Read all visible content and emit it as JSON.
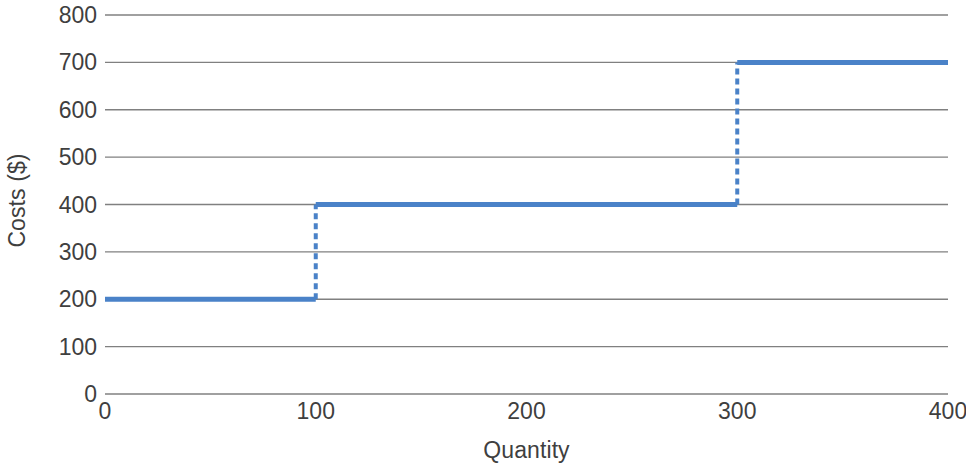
{
  "chart_data": {
    "type": "line",
    "subtype": "step",
    "title": "",
    "subtitle": "",
    "xlabel": "Quantity",
    "ylabel": "Costs ($)",
    "xlim": [
      0,
      400
    ],
    "ylim": [
      0,
      800
    ],
    "x_ticks": [
      0,
      100,
      200,
      300,
      400
    ],
    "x_tick_labels": [
      "0",
      "100",
      "200",
      "300",
      "400"
    ],
    "y_ticks": [
      0,
      100,
      200,
      300,
      400,
      500,
      600,
      700,
      800
    ],
    "y_tick_labels": [
      "0",
      "100",
      "200",
      "300",
      "400",
      "500",
      "600",
      "700",
      "800"
    ],
    "grid": {
      "horizontal": true,
      "vertical": false,
      "color": "#808080"
    },
    "legend": {
      "visible": false,
      "position": "none",
      "entries": []
    },
    "annotations": [],
    "series": [
      {
        "name": "Costs",
        "color": "#4A82C8",
        "line_width": 5,
        "steps": [
          {
            "x_start": 0,
            "x_end": 100,
            "y": 200
          },
          {
            "x_start": 100,
            "x_end": 300,
            "y": 400
          },
          {
            "x_start": 300,
            "x_end": 400,
            "y": 700
          }
        ],
        "risers": [
          {
            "x": 100,
            "y_from": 200,
            "y_to": 400,
            "style": "dashed"
          },
          {
            "x": 300,
            "y_from": 400,
            "y_to": 700,
            "style": "dashed"
          }
        ],
        "points": [
          {
            "x": 0,
            "y": 200
          },
          {
            "x": 100,
            "y": 200
          },
          {
            "x": 100,
            "y": 400
          },
          {
            "x": 300,
            "y": 400
          },
          {
            "x": 300,
            "y": 700
          },
          {
            "x": 400,
            "y": 700
          }
        ]
      }
    ]
  },
  "axes": {
    "y_title": "Costs ($)",
    "x_title": "Quantity"
  },
  "colors": {
    "series": "#4A82C8",
    "grid": "#808080",
    "text": "#3f3f3f",
    "background": "#ffffff"
  }
}
